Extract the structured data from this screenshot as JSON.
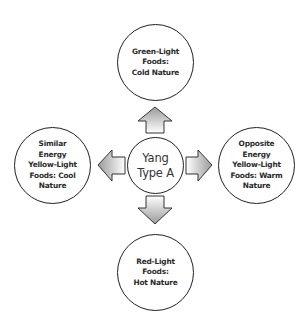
{
  "diagram": {
    "type": "hub-and-spoke",
    "center": {
      "label": "Yang\nType A"
    },
    "nodes": {
      "top": {
        "label": "Green-Light\nFoods:\nCold Nature",
        "direction": "up"
      },
      "left": {
        "label": "Similar\nEnergy\nYellow-Light\nFoods: Cool\nNature",
        "direction": "left"
      },
      "right": {
        "label": "Opposite\nEnergy\nYellow-Light\nFoods: Warm\nNature",
        "direction": "right"
      },
      "bottom": {
        "label": "Red-Light\nFoods:\nHot Nature",
        "direction": "down"
      }
    },
    "colors": {
      "stroke": "#222222",
      "text": "#2a2a2a",
      "arrow_gradient_light": "#ffffff",
      "arrow_gradient_dark": "#9a9a9a"
    }
  }
}
